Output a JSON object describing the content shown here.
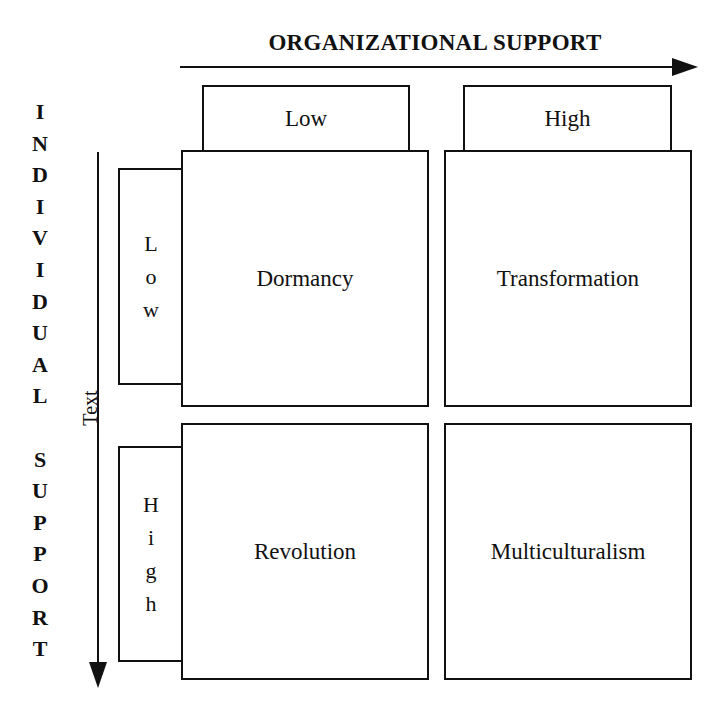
{
  "diagram": {
    "x_axis": {
      "title": "ORGANIZATIONAL SUPPORT",
      "levels": [
        "Low",
        "High"
      ]
    },
    "y_axis": {
      "title_word1_letters": [
        "I",
        "N",
        "D",
        "I",
        "V",
        "I",
        "D",
        "U",
        "A",
        "L"
      ],
      "title_word2_letters": [
        "S",
        "U",
        "P",
        "P",
        "O",
        "R",
        "T"
      ],
      "title": "INDIVIDUAL SUPPORT",
      "axis_text": "Text",
      "levels": [
        {
          "label": "Low",
          "letters": [
            "L",
            "o",
            "w"
          ]
        },
        {
          "label": "High",
          "letters": [
            "H",
            "i",
            "g",
            "h"
          ]
        }
      ]
    },
    "quadrants": [
      {
        "row": "Low",
        "col": "Low",
        "label": "Dormancy"
      },
      {
        "row": "Low",
        "col": "High",
        "label": "Transformation"
      },
      {
        "row": "High",
        "col": "Low",
        "label": "Revolution"
      },
      {
        "row": "High",
        "col": "High",
        "label": "Multiculturalism"
      }
    ],
    "colors": {
      "line": "#111111",
      "background": "#ffffff"
    }
  }
}
